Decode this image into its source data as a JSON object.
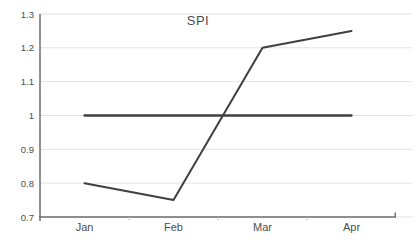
{
  "chart_data": {
    "type": "line",
    "title": "SPI",
    "categories": [
      "Jan",
      "Feb",
      "Mar",
      "Apr"
    ],
    "series": [
      {
        "name": "spi",
        "values": [
          0.8,
          0.75,
          1.2,
          1.25
        ],
        "width": 2
      },
      {
        "name": "baseline",
        "values": [
          1,
          1,
          1,
          1
        ],
        "width": 2.3
      }
    ],
    "y_ticks": [
      "1.3",
      "1.2",
      "1.1",
      "1",
      "0.9",
      "0.8",
      "0.7"
    ],
    "y_tick_values": [
      1.3,
      1.2,
      1.1,
      1.0,
      0.9,
      0.8,
      0.7
    ],
    "ylim": [
      0.7,
      1.3
    ],
    "xlabel": "",
    "ylabel": "",
    "grid": true,
    "legend": false,
    "colors": {
      "line": "#3f3f3f",
      "axis": "#6e6e6e",
      "grid": "#e2e2e2",
      "tick": "#c4c4c4",
      "label": "#4d4d4d",
      "background": "#ffffff"
    }
  }
}
